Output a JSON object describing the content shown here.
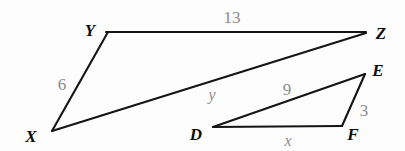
{
  "figure": {
    "background_color": "#fdfdfd",
    "stroke_color": "#141414",
    "label_color": "#0d0d0d",
    "measure_color": "#8c8c8c"
  },
  "vertices": {
    "Y": {
      "label": "Y",
      "x": 108,
      "y": 32,
      "label_x": 90,
      "label_y": 30
    },
    "Z": {
      "label": "Z",
      "x": 366,
      "y": 32,
      "label_x": 381,
      "label_y": 33
    },
    "X": {
      "label": "X",
      "x": 52,
      "y": 131,
      "label_x": 31,
      "label_y": 136
    },
    "E": {
      "label": "E",
      "x": 365,
      "y": 74,
      "label_x": 378,
      "label_y": 70
    },
    "D": {
      "label": "D",
      "x": 213,
      "y": 127,
      "label_x": 196,
      "label_y": 134
    },
    "F": {
      "label": "F",
      "x": 342,
      "y": 126,
      "label_x": 353,
      "label_y": 134
    }
  },
  "measures": [
    {
      "id": "YZ",
      "text": "13",
      "x": 232,
      "y": 17,
      "style": "number"
    },
    {
      "id": "XY",
      "text": "6",
      "x": 62,
      "y": 84,
      "style": "number"
    },
    {
      "id": "XZ",
      "text": "y",
      "x": 212,
      "y": 95,
      "style": "variable"
    },
    {
      "id": "DE",
      "text": "9",
      "x": 287,
      "y": 89,
      "style": "number"
    },
    {
      "id": "EF",
      "text": "3",
      "x": 364,
      "y": 110,
      "style": "number"
    },
    {
      "id": "DF",
      "text": "x",
      "x": 288,
      "y": 141,
      "style": "variable"
    }
  ],
  "chart_data": {
    "type": "diagram",
    "shapes": [
      {
        "name": "triangle-XYZ",
        "vertices": [
          "X",
          "Y",
          "Z"
        ],
        "points": [
          [
            52,
            131
          ],
          [
            108,
            32
          ],
          [
            366,
            32
          ]
        ],
        "sides": [
          {
            "from": "X",
            "to": "Y",
            "length_label": "6"
          },
          {
            "from": "Y",
            "to": "Z",
            "length_label": "13"
          },
          {
            "from": "X",
            "to": "Z",
            "length_label": "y"
          }
        ]
      },
      {
        "name": "triangle-DEF",
        "vertices": [
          "D",
          "E",
          "F"
        ],
        "points": [
          [
            213,
            127
          ],
          [
            365,
            74
          ],
          [
            342,
            126
          ]
        ],
        "sides": [
          {
            "from": "D",
            "to": "E",
            "length_label": "9"
          },
          {
            "from": "E",
            "to": "F",
            "length_label": "3"
          },
          {
            "from": "D",
            "to": "F",
            "length_label": "x"
          }
        ]
      }
    ]
  }
}
